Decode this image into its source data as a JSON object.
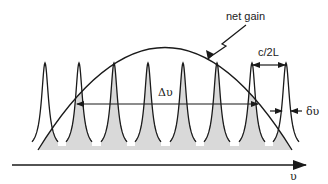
{
  "diagram": {
    "labels": {
      "net_gain": "net gain",
      "mode_spacing": "c/2L",
      "gain_bandwidth": "Δυ",
      "linewidth": "δυ",
      "frequency_axis": "υ"
    },
    "colors": {
      "line": "#1a1a1a",
      "fill": "#d9d9d9",
      "background": "#ffffff"
    },
    "modes": {
      "count": 8,
      "peak_x": [
        45,
        79,
        114,
        148,
        183,
        217,
        252,
        286
      ],
      "peak_top_y": 63,
      "baseline_y": 150,
      "lasing_modes_shaded": [
        2,
        3,
        4,
        5,
        6,
        7
      ]
    }
  }
}
